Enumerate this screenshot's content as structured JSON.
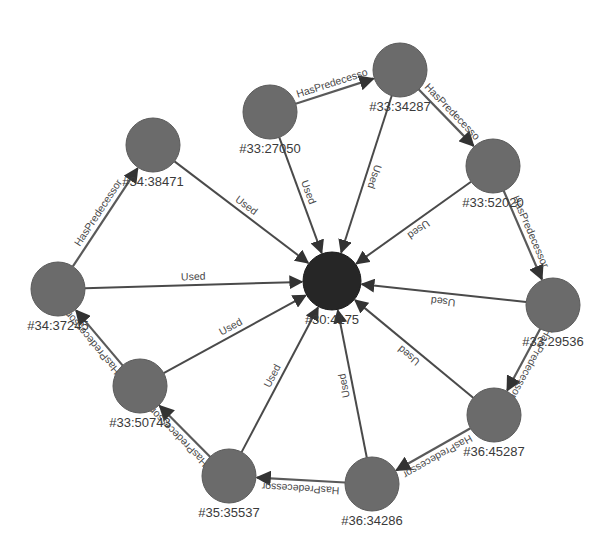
{
  "diagram": {
    "type": "graph",
    "center_node": {
      "id": "center",
      "label": "#30:4175",
      "x": 332,
      "y": 281,
      "r": 29
    },
    "nodes": [
      {
        "id": "n27050",
        "label": "#33:27050",
        "x": 270,
        "y": 112,
        "r": 27
      },
      {
        "id": "n34287",
        "label": "#33:34287",
        "x": 400,
        "y": 70,
        "r": 27
      },
      {
        "id": "n52020",
        "label": "#33:52020",
        "x": 493,
        "y": 166,
        "r": 27
      },
      {
        "id": "n29536",
        "label": "#33:29536",
        "x": 553,
        "y": 305,
        "r": 27
      },
      {
        "id": "n45287",
        "label": "#36:45287",
        "x": 494,
        "y": 415,
        "r": 27
      },
      {
        "id": "n34286",
        "label": "#36:34286",
        "x": 372,
        "y": 484,
        "r": 27
      },
      {
        "id": "n35537",
        "label": "#35:35537",
        "x": 229,
        "y": 476,
        "r": 27
      },
      {
        "id": "n50743",
        "label": "#33:50743",
        "x": 140,
        "y": 386,
        "r": 27
      },
      {
        "id": "n37245",
        "label": "#34:37245",
        "x": 58,
        "y": 289,
        "r": 27
      },
      {
        "id": "n38471",
        "label": "#34:38471",
        "x": 153,
        "y": 145,
        "r": 27
      }
    ],
    "edges": [
      {
        "from": "n27050",
        "to": "n34287",
        "label": "HasPredecesso",
        "kind": "pred"
      },
      {
        "from": "n34287",
        "to": "n52020",
        "label": "HasPredecesso",
        "kind": "pred"
      },
      {
        "from": "n52020",
        "to": "n29536",
        "label": "HasPredecessor",
        "kind": "pred"
      },
      {
        "from": "n29536",
        "to": "n45287",
        "label": "HasPredecessor",
        "kind": "pred"
      },
      {
        "from": "n45287",
        "to": "n34286",
        "label": "HasPredecessor",
        "kind": "pred"
      },
      {
        "from": "n34286",
        "to": "n35537",
        "label": "HasPredecessor",
        "kind": "pred"
      },
      {
        "from": "n35537",
        "to": "n50743",
        "label": "HasPredecessor",
        "kind": "pred"
      },
      {
        "from": "n50743",
        "to": "n37245",
        "label": "HasPredecessor",
        "kind": "pred"
      },
      {
        "from": "n37245",
        "to": "n38471",
        "label": "HasPredecessor",
        "kind": "pred"
      },
      {
        "from": "n27050",
        "to": "center",
        "label": "Used",
        "kind": "used"
      },
      {
        "from": "n34287",
        "to": "center",
        "label": "Used",
        "kind": "used"
      },
      {
        "from": "n52020",
        "to": "center",
        "label": "Used",
        "kind": "used"
      },
      {
        "from": "n29536",
        "to": "center",
        "label": "Used",
        "kind": "used"
      },
      {
        "from": "n45287",
        "to": "center",
        "label": "Used",
        "kind": "used"
      },
      {
        "from": "n34286",
        "to": "center",
        "label": "Used",
        "kind": "used"
      },
      {
        "from": "n35537",
        "to": "center",
        "label": "Used",
        "kind": "used"
      },
      {
        "from": "n50743",
        "to": "center",
        "label": "Used",
        "kind": "used"
      },
      {
        "from": "n37245",
        "to": "center",
        "label": "Used",
        "kind": "used"
      },
      {
        "from": "n38471",
        "to": "center",
        "label": "Used",
        "kind": "used"
      }
    ]
  }
}
